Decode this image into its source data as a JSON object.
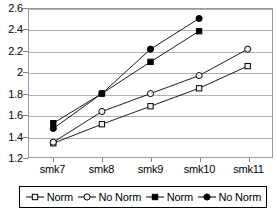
{
  "chart_data": {
    "type": "line",
    "title": "",
    "xlabel": "",
    "ylabel": "",
    "categories": [
      "smk7",
      "smk8",
      "smk9",
      "smk10",
      "smk11"
    ],
    "ylim": [
      1.2,
      2.6
    ],
    "ytick_step": 0.2,
    "ytick_labels": [
      "2.6",
      "2.4",
      "2.2",
      "2",
      "1.8",
      "1.6",
      "1.4",
      "1.2"
    ],
    "ytick_values": [
      2.6,
      2.4,
      2.2,
      2.0,
      1.8,
      1.6,
      1.4,
      1.2
    ],
    "grid": "horizontal",
    "legend_position": "bottom",
    "series": [
      {
        "name": "Norm",
        "marker": "open-square",
        "color": "#000000",
        "values": [
          1.33,
          1.51,
          1.68,
          1.85,
          2.06
        ]
      },
      {
        "name": "No Norm",
        "marker": "open-circle",
        "color": "#000000",
        "values": [
          1.34,
          1.63,
          1.8,
          1.97,
          2.22
        ]
      },
      {
        "name": "Norm",
        "marker": "filled-square",
        "color": "#000000",
        "values": [
          1.52,
          1.8,
          2.1,
          2.39,
          null
        ]
      },
      {
        "name": "No Norm",
        "marker": "filled-circle",
        "color": "#000000",
        "values": [
          1.47,
          1.8,
          2.22,
          2.51,
          null
        ]
      }
    ]
  },
  "legend": {
    "entries": [
      {
        "label": "Norm",
        "marker": "open-square"
      },
      {
        "label": "No Norm",
        "marker": "open-circle"
      },
      {
        "label": "Norm",
        "marker": "filled-square"
      },
      {
        "label": "No Norm",
        "marker": "filled-circle"
      }
    ]
  },
  "colors": {
    "line": "#000000",
    "grid": "#b0b0b0",
    "plot_border": "#999999",
    "legend_border": "#000000",
    "background": "#ffffff"
  }
}
